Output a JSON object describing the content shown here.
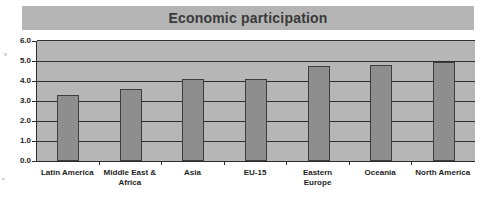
{
  "chart_data": {
    "type": "bar",
    "title": "Economic participation",
    "xlabel": "",
    "ylabel": "",
    "categories": [
      "Latin America",
      "Middle East & Africa",
      "Asia",
      "EU-15",
      "Eastern Europe",
      "Oceania",
      "North America"
    ],
    "values": [
      3.3,
      3.6,
      4.1,
      4.1,
      4.75,
      4.8,
      4.95
    ],
    "ylim": [
      0.0,
      6.0
    ],
    "ytick_labels": [
      "0.0",
      "1.0",
      "2.0",
      "3.0",
      "4.0",
      "5.0",
      "6.0"
    ],
    "ytick_values": [
      0.0,
      1.0,
      2.0,
      3.0,
      4.0,
      5.0,
      6.0
    ],
    "grid": "horizontal",
    "legend": "none",
    "colors": {
      "bar_fill": "#8e8e8e",
      "bar_border": "#3d3d3d",
      "plot_background": "#b6b6b6",
      "title_band": "#b4b4b4",
      "axis": "#2b2b2b",
      "text": "#232323",
      "page_background": "#ffffff"
    }
  },
  "chart": {
    "title": "Economic participation",
    "y_axis": {
      "ticks": [
        {
          "label": "6.0",
          "value": 6.0
        },
        {
          "label": "5.0",
          "value": 5.0
        },
        {
          "label": "4.0",
          "value": 4.0
        },
        {
          "label": "3.0",
          "value": 3.0
        },
        {
          "label": "2.0",
          "value": 2.0
        },
        {
          "label": "1.0",
          "value": 1.0
        },
        {
          "label": "0.0",
          "value": 0.0
        }
      ]
    },
    "bars": [
      {
        "label": "Latin America",
        "label_line1": "Latin America",
        "label_line2": "",
        "value": 3.3
      },
      {
        "label": "Middle East & Africa",
        "label_line1": "Middle East &",
        "label_line2": "Africa",
        "value": 3.6
      },
      {
        "label": "Asia",
        "label_line1": "Asia",
        "label_line2": "",
        "value": 4.1
      },
      {
        "label": "EU-15",
        "label_line1": "EU-15",
        "label_line2": "",
        "value": 4.1
      },
      {
        "label": "Eastern Europe",
        "label_line1": "Eastern",
        "label_line2": "Europe",
        "value": 4.75
      },
      {
        "label": "Oceania",
        "label_line1": "Oceania",
        "label_line2": "",
        "value": 4.8
      },
      {
        "label": "North America",
        "label_line1": "North America",
        "label_line2": "",
        "value": 4.95
      }
    ]
  }
}
